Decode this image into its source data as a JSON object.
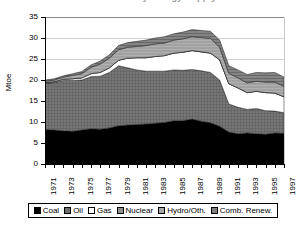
{
  "title": "Total Primary Energy Supply",
  "axes": {
    "ylabel": "Mtoe",
    "yticks": [
      "0",
      "5",
      "10",
      "15",
      "20",
      "25",
      "30",
      "35"
    ],
    "xticks": [
      "1971",
      "1973",
      "1975",
      "1977",
      "1979",
      "1981",
      "1983",
      "1985",
      "1987",
      "1989",
      "1991",
      "1993",
      "1995",
      "1997"
    ]
  },
  "legend": {
    "items": [
      {
        "label": "Coal",
        "color": "#000000",
        "swatch": "sw-coal"
      },
      {
        "label": "Oil",
        "color": "#6f6f6f",
        "swatch": "sw-oil"
      },
      {
        "label": "Gas",
        "color": "#ffffff",
        "swatch": "sw-gas"
      },
      {
        "label": "Nuclear",
        "color": "#8f8f8f",
        "swatch": "sw-nuclear"
      },
      {
        "label": "Hydro/Oth.",
        "color": "#a8a8a8",
        "swatch": "sw-hydro"
      },
      {
        "label": "Comb. Renew.",
        "color": "#7d7d7d",
        "swatch": "sw-renew"
      }
    ]
  },
  "chart_data": {
    "type": "area",
    "stacked": true,
    "title": "Total Primary Energy Supply",
    "xlabel": "",
    "ylabel": "Mtoe",
    "ylim": [
      0,
      35
    ],
    "xlim": [
      1971,
      1997
    ],
    "grid": true,
    "legend_position": "bottom",
    "x": [
      1971,
      1972,
      1973,
      1974,
      1975,
      1976,
      1977,
      1978,
      1979,
      1980,
      1981,
      1982,
      1983,
      1984,
      1985,
      1986,
      1987,
      1988,
      1989,
      1990,
      1991,
      1992,
      1993,
      1994,
      1995,
      1996,
      1997
    ],
    "series": [
      {
        "name": "Coal",
        "values": [
          8.2,
          8.1,
          7.9,
          7.8,
          8.1,
          8.4,
          8.3,
          8.6,
          9.1,
          9.3,
          9.4,
          9.5,
          9.7,
          9.9,
          10.3,
          10.3,
          10.7,
          10.2,
          9.8,
          9.0,
          7.6,
          7.2,
          7.4,
          7.2,
          7.1,
          7.4,
          7.3
        ]
      },
      {
        "name": "Oil",
        "values": [
          11.0,
          11.3,
          12.0,
          12.1,
          11.9,
          12.4,
          12.6,
          13.2,
          14.3,
          13.6,
          13.0,
          12.6,
          12.4,
          12.2,
          12.1,
          12.0,
          11.8,
          12.0,
          12.0,
          11.0,
          6.7,
          6.3,
          5.6,
          6.0,
          5.6,
          5.2,
          4.9
        ]
      },
      {
        "name": "Gas",
        "values": [
          0.2,
          0.2,
          0.3,
          0.4,
          0.5,
          0.7,
          0.9,
          1.1,
          1.3,
          2.3,
          2.9,
          3.2,
          3.5,
          3.7,
          4.0,
          4.3,
          4.5,
          4.5,
          4.6,
          4.8,
          4.8,
          4.6,
          4.0,
          4.1,
          4.3,
          4.3,
          3.8
        ]
      },
      {
        "name": "Nuclear",
        "values": [
          0.0,
          0.0,
          0.0,
          0.0,
          0.0,
          0.0,
          0.0,
          0.0,
          0.0,
          0.0,
          0.0,
          0.0,
          0.0,
          0.0,
          0.0,
          0.0,
          0.0,
          0.0,
          0.0,
          0.0,
          0.0,
          0.0,
          0.0,
          0.0,
          0.0,
          0.0,
          0.0
        ]
      },
      {
        "name": "Hydro/Oth.",
        "values": [
          0.3,
          0.4,
          0.5,
          0.8,
          1.0,
          1.5,
          2.0,
          2.3,
          2.5,
          2.6,
          2.7,
          2.9,
          3.0,
          3.0,
          3.1,
          3.2,
          3.3,
          3.4,
          3.5,
          3.0,
          2.5,
          2.4,
          2.3,
          2.4,
          2.5,
          2.6,
          2.5
        ]
      },
      {
        "name": "Comb. Renew.",
        "values": [
          0.3,
          0.3,
          0.3,
          0.4,
          0.5,
          0.6,
          0.7,
          0.8,
          1.0,
          1.1,
          1.2,
          1.3,
          1.4,
          1.5,
          1.5,
          1.6,
          1.7,
          1.7,
          1.7,
          1.7,
          1.8,
          1.9,
          2.0,
          2.1,
          2.2,
          2.3,
          2.2
        ]
      }
    ],
    "totals": [
      20.0,
      20.3,
      21.0,
      21.5,
      22.0,
      23.6,
      24.5,
      26.0,
      28.2,
      28.9,
      29.2,
      29.5,
      30.0,
      30.3,
      31.0,
      31.4,
      32.0,
      31.8,
      31.6,
      29.5,
      23.4,
      22.4,
      21.3,
      21.8,
      21.7,
      21.8,
      20.7
    ]
  }
}
